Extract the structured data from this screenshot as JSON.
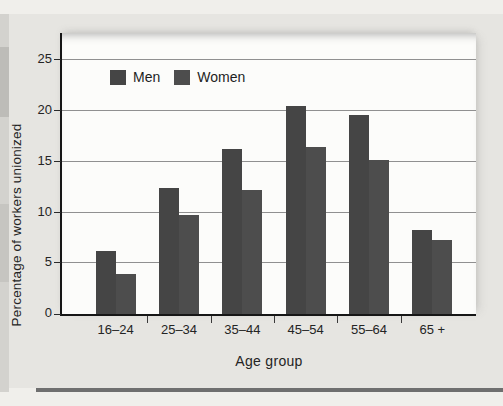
{
  "chart_data": {
    "type": "bar",
    "title": "",
    "categories": [
      "16–24",
      "25–34",
      "35–44",
      "45–54",
      "55–64",
      "65 +"
    ],
    "series": [
      {
        "name": "Men",
        "color": "#454545",
        "values": [
          6.2,
          12.4,
          16.3,
          20.5,
          19.6,
          8.3
        ]
      },
      {
        "name": "Women",
        "color": "#4d4d4d",
        "values": [
          3.9,
          9.8,
          12.2,
          16.5,
          15.2,
          7.3
        ]
      }
    ],
    "xlabel": "Age group",
    "ylabel": "Percentage of workers unionized",
    "ylim": [
      0,
      27.7
    ],
    "yticks": [
      0,
      5,
      10,
      15,
      20,
      25
    ],
    "grid": true,
    "legend_position": "top-left-inside",
    "bar_width_px": 20
  },
  "colors": {
    "page_background": "#f0efeb",
    "card_background": "#e6e5e1",
    "plot_background": "#fcfcfa",
    "axis": "#161616",
    "gridline": "#909090",
    "bottom_rule": "#6f6f6f"
  }
}
